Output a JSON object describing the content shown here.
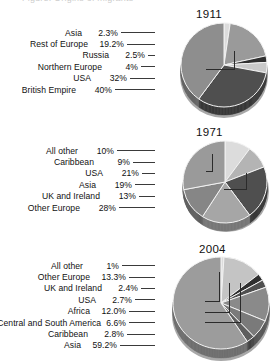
{
  "figure": {
    "cropped_caption": "Figure: Origins of migrants",
    "background_color": "#ffffff"
  },
  "palette": {
    "very_light": "#dcdcdc",
    "light": "#c9c9c9",
    "light_mid": "#b4b4b4",
    "mid": "#9a9a9a",
    "mid_dark": "#868686",
    "dark": "#6f6f6f",
    "very_dark": "#4f4f4f",
    "near_black": "#2f2f2f",
    "shadow": "#a8a8a8",
    "leader_line": "#3a3a3a",
    "text": "#111111"
  },
  "chart_data": [
    {
      "type": "pie",
      "title": "1911",
      "xlabel": "",
      "ylabel": "",
      "legend_position": "left-leader-lines",
      "grid": false,
      "categories": [
        "Asia",
        "Rest of Europe",
        "Russia",
        "Northern Europe",
        "USA",
        "British Empire"
      ],
      "values": [
        2.3,
        19.2,
        2.5,
        4,
        32,
        40
      ],
      "value_labels": [
        "2.3%",
        "19.2%",
        "2.5%",
        "4%",
        "32%",
        "40%"
      ],
      "slice_colors": [
        "#dcdcdc",
        "#9a9a9a",
        "#2f2f2f",
        "#c9c9c9",
        "#4f4f4f",
        "#8e8e8e"
      ]
    },
    {
      "type": "pie",
      "title": "1971",
      "xlabel": "",
      "ylabel": "",
      "legend_position": "left-leader-lines",
      "grid": false,
      "categories": [
        "All other",
        "Caribbean",
        "USA",
        "Asia",
        "UK and Ireland",
        "Other Europe"
      ],
      "values": [
        10,
        9,
        21,
        19,
        13,
        28
      ],
      "value_labels": [
        "10%",
        "9%",
        "21%",
        "19%",
        "13%",
        "28%"
      ],
      "slice_colors": [
        "#dcdcdc",
        "#b4b4b4",
        "#4f4f4f",
        "#a6a6a6",
        "#868686",
        "#9a9a9a"
      ]
    },
    {
      "type": "pie",
      "title": "2004",
      "xlabel": "",
      "ylabel": "",
      "legend_position": "left-leader-lines",
      "grid": false,
      "categories": [
        "All other",
        "Other Europe",
        "UK and Ireland",
        "USA",
        "Africa",
        "Central and South America",
        "Caribbean",
        "Asia"
      ],
      "values": [
        1,
        13.3,
        2.4,
        2.7,
        12.0,
        6.6,
        2.8,
        59.2
      ],
      "value_labels": [
        "1%",
        "13.3%",
        "2.4%",
        "2.7%",
        "12.0%",
        "6.6%",
        "2.8%",
        "59.2%"
      ],
      "slice_colors": [
        "#dcdcdc",
        "#c4c4c4",
        "#2f2f2f",
        "#4f4f4f",
        "#8a8a8a",
        "#7a7a7a",
        "#5e5e5e",
        "#9c9c9c"
      ]
    }
  ]
}
